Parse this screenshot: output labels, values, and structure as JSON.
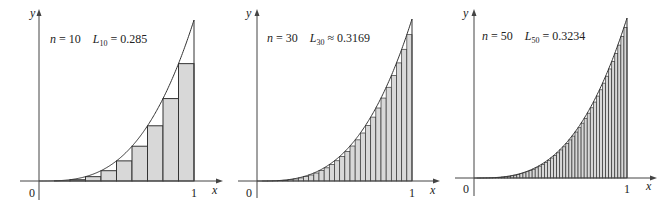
{
  "chart_data": [
    {
      "type": "bar",
      "title": "Left Riemann sum of y = x^3 on [0,1], n = 10",
      "function": "x^3",
      "n": 10,
      "annotation": {
        "n_label": "n = 10",
        "sum_symbol": "L",
        "sum_sub": "10",
        "relation": "=",
        "value": "0.285"
      },
      "xlabel": "x",
      "ylabel": "y",
      "x_ticks": [
        "0",
        "1"
      ],
      "xlim": [
        0,
        1
      ],
      "ylim": [
        0,
        1
      ]
    },
    {
      "type": "bar",
      "title": "Left Riemann sum of y = x^3 on [0,1], n = 30",
      "function": "x^3",
      "n": 30,
      "annotation": {
        "n_label": "n = 30",
        "sum_symbol": "L",
        "sum_sub": "30",
        "relation": "≈",
        "value": "0.3169"
      },
      "xlabel": "x",
      "ylabel": "y",
      "x_ticks": [
        "0",
        "1"
      ],
      "xlim": [
        0,
        1
      ],
      "ylim": [
        0,
        1
      ]
    },
    {
      "type": "bar",
      "title": "Left Riemann sum of y = x^3 on [0,1], n = 50",
      "function": "x^3",
      "n": 50,
      "annotation": {
        "n_label": "n = 50",
        "sum_symbol": "L",
        "sum_sub": "50",
        "relation": "=",
        "value": "0.3234"
      },
      "xlabel": "x",
      "ylabel": "y",
      "x_ticks": [
        "0",
        "1"
      ],
      "xlim": [
        0,
        1
      ],
      "ylim": [
        0,
        1
      ]
    }
  ],
  "panels": [
    {
      "ox": 39,
      "oy": 181,
      "x1": 194,
      "ytop": 20,
      "yaxis_top": 14,
      "xaxis_left": 20,
      "xaxis_right": 218,
      "yaxis_bottom": 200
    },
    {
      "ox": 257,
      "oy": 181,
      "x1": 412,
      "ytop": 19,
      "yaxis_top": 14,
      "xaxis_left": 238,
      "xaxis_right": 435,
      "yaxis_bottom": 198
    },
    {
      "ox": 474,
      "oy": 178,
      "x1": 627,
      "ytop": 18,
      "yaxis_top": 14,
      "xaxis_left": 455,
      "xaxis_right": 652,
      "yaxis_bottom": 196
    }
  ],
  "colors": {
    "fill": "#d8d8d8",
    "stroke": "#333333",
    "axis": "#444444"
  }
}
